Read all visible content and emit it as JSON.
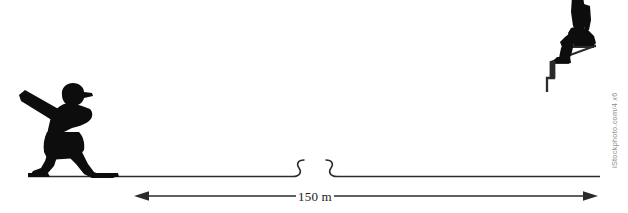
{
  "figure": {
    "name": "distance-between-batter-and-seated-observer",
    "background_color": "#ffffff",
    "ink_color": "#0d0d0d",
    "line_color": "#2b2b2b",
    "width": 628,
    "height": 213
  },
  "dimension": {
    "label": "150 m",
    "value": 150,
    "unit": "m",
    "arrow_style": "double-headed",
    "left_arrow_x": 134,
    "right_arrow_x": 598,
    "baseline_y": 196
  },
  "ground": {
    "label": "ground-line",
    "start_x": 28,
    "end_x": 600,
    "y": 176,
    "break_marks": [
      {
        "name": "break-mark-left",
        "x": 295
      },
      {
        "name": "break-mark-right",
        "x": 327
      }
    ]
  },
  "actors": [
    {
      "id": "batter",
      "label": "baseball-batter-silhouette",
      "description": "Silhouette of a baseball batter in a wide stance holding a bat angled up and to the left, wearing a cap with the brim pointing right.",
      "position": "left",
      "props": [
        "baseball-bat",
        "cap"
      ]
    },
    {
      "id": "seated-observer",
      "label": "seated-figure-on-stairs-silhouette",
      "description": "Silhouette of a person seated on the top step of a flight of stairs, legs bent, cropped at the top edge of the frame.",
      "position": "right",
      "props": [
        "staircase"
      ]
    }
  ],
  "staircase": {
    "label": "staircase",
    "step_count": 3,
    "descends_toward": "left"
  },
  "watermark": {
    "text": "iStockphoto.com/4 x6",
    "orientation": "vertical",
    "color": "#8e8e8e"
  }
}
